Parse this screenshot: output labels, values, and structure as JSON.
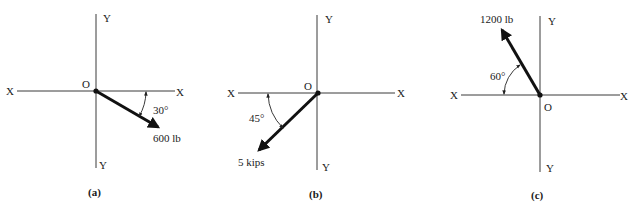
{
  "figure": {
    "panels": [
      {
        "id": "a",
        "caption": "(a)",
        "axis_labels": {
          "x_left": "X",
          "x_right": "X",
          "y_top": "Y",
          "y_bottom": "Y"
        },
        "origin_label": "O",
        "force": {
          "magnitude_label": "600 lb",
          "direction": "down-right",
          "angle_label": "30°",
          "angle_reference": "below +X axis"
        }
      },
      {
        "id": "b",
        "caption": "(b)",
        "axis_labels": {
          "x_left": "X",
          "x_right": "X",
          "y_top": "Y",
          "y_bottom": "Y"
        },
        "origin_label": "O",
        "force": {
          "magnitude_label": "5 kips",
          "direction": "down-left",
          "angle_label": "45°",
          "angle_reference": "below -X axis"
        }
      },
      {
        "id": "c",
        "caption": "(c)",
        "axis_labels": {
          "x_left": "X",
          "x_right": "X",
          "y_top": "Y",
          "y_bottom": "Y"
        },
        "origin_label": "O",
        "force": {
          "magnitude_label": "1200 lb",
          "direction": "up-left",
          "angle_label": "60°",
          "angle_reference": "above -X axis"
        }
      }
    ]
  }
}
